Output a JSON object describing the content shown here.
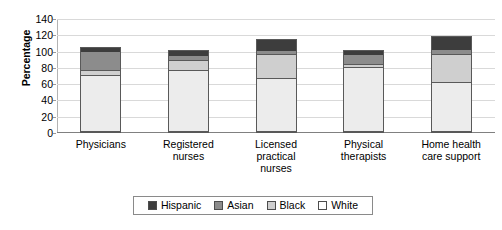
{
  "chart_data": {
    "type": "bar",
    "subtype": "stacked-bar",
    "title": "",
    "xlabel": "",
    "ylabel": "Percentage",
    "ylim": [
      0,
      140
    ],
    "ytick_step": 20,
    "yticks": [
      140,
      120,
      100,
      80,
      60,
      40,
      20,
      0
    ],
    "grid": true,
    "legend_position": "bottom-center",
    "categories": [
      "Physicians",
      "Registered nurses",
      "Licensed practical nurses",
      "Physical therapists",
      "Home health care support"
    ],
    "category_lines": [
      [
        "Physicians"
      ],
      [
        "Registered",
        "nurses"
      ],
      [
        "Licensed",
        "practical",
        "nurses"
      ],
      [
        "Physical",
        "therapists"
      ],
      [
        "Home health",
        "care support"
      ]
    ],
    "series": [
      {
        "name": "White",
        "color": "#ececec",
        "values": [
          72,
          78,
          67,
          82,
          62
        ]
      },
      {
        "name": "Black",
        "color": "#cfcfcf",
        "values": [
          5,
          12,
          30,
          3,
          35
        ]
      },
      {
        "name": "Asian",
        "color": "#8c8c8c",
        "values": [
          24,
          5,
          4,
          12,
          5
        ]
      },
      {
        "name": "Hispanic",
        "color": "#3d3d3d",
        "values": [
          5,
          7,
          14,
          5,
          17
        ]
      }
    ],
    "stack_order_bottom_to_top": [
      "White",
      "Black",
      "Asian",
      "Hispanic"
    ],
    "totals": [
      106,
      102,
      115,
      102,
      119
    ],
    "legend": [
      {
        "label": "Hispanic",
        "color": "#3d3d3d"
      },
      {
        "label": "Asian",
        "color": "#8c8c8c"
      },
      {
        "label": "Black",
        "color": "#cfcfcf"
      },
      {
        "label": "White",
        "color": "#ffffff"
      }
    ]
  }
}
